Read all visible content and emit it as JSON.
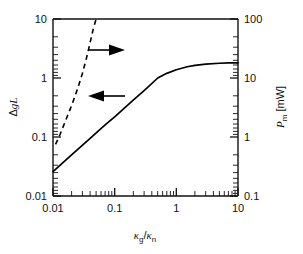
{
  "chart_data": {
    "type": "line",
    "title": "",
    "xlabel": "κ_g / κ_n",
    "xlabel_parts": {
      "kappa1": "κ",
      "sub1": "g",
      "slash": "/",
      "kappa2": "κ",
      "sub2": "n"
    },
    "ylabel_left": "ΔgL",
    "ylabel_left_parts": {
      "delta": "Δ",
      "g": "g",
      "L": "L"
    },
    "ylabel_right": "P_m [mW]",
    "ylabel_right_parts": {
      "P": "P",
      "sub": "m",
      "unit": "[mW]"
    },
    "xscale": "log",
    "yscale": "log",
    "xlim": [
      0.01,
      10
    ],
    "ylim_left": [
      0.01,
      10
    ],
    "ylim_right": [
      0.1,
      100
    ],
    "grid": false,
    "legend": "none",
    "xticks": [
      0.01,
      0.1,
      1,
      10
    ],
    "xtick_labels": [
      "0.01",
      "0.1",
      "1",
      "10"
    ],
    "yticks_left": [
      0.01,
      0.1,
      1,
      10
    ],
    "ytick_labels_left": [
      "0.01",
      "0.1",
      "1",
      "10"
    ],
    "yticks_right": [
      0.1,
      1,
      10,
      100
    ],
    "ytick_labels_right": [
      "0.1",
      "1",
      "10",
      "100"
    ],
    "minor_ticks": true,
    "series": [
      {
        "name": "ΔgL",
        "style": "solid",
        "axis": "left",
        "color": "#000000",
        "arrow": "left",
        "x": [
          0.01,
          0.02,
          0.04,
          0.07,
          0.1,
          0.2,
          0.3,
          0.5,
          0.7,
          1.0,
          1.5,
          2.0,
          3.0,
          5.0,
          7.0,
          10.0
        ],
        "y": [
          0.026,
          0.05,
          0.095,
          0.16,
          0.22,
          0.42,
          0.61,
          1.0,
          1.2,
          1.38,
          1.55,
          1.64,
          1.72,
          1.78,
          1.8,
          1.81
        ]
      },
      {
        "name": "P_m",
        "style": "dashed",
        "axis": "right",
        "color": "#000000",
        "arrow": "right",
        "x": [
          0.011,
          0.013,
          0.016,
          0.02,
          0.025,
          0.03,
          0.035,
          0.04,
          0.045,
          0.05
        ],
        "y": [
          0.75,
          1.1,
          1.9,
          3.4,
          6.5,
          12.0,
          22.0,
          40.0,
          68.0,
          100.0
        ]
      }
    ],
    "annotations": [
      {
        "name": "right-arrow",
        "target_axis": "right",
        "direction": "right",
        "x_px": 92,
        "y_px": 50
      },
      {
        "name": "left-arrow",
        "target_axis": "left",
        "direction": "left",
        "x_px": 92,
        "y_px": 96
      }
    ],
    "colors": {
      "axis": "#111111",
      "curve": "#000000",
      "background": "#ffffff"
    }
  }
}
